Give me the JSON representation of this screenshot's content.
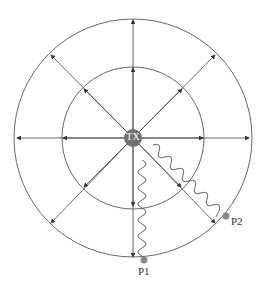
{
  "diagram": {
    "center_label": "TX",
    "points": [
      {
        "label": "P1",
        "x": 144,
        "y": 260
      },
      {
        "label": "P2",
        "x": 226,
        "y": 216
      }
    ],
    "colors": {
      "line": "#444444",
      "node": "#707070",
      "point": "#888888"
    },
    "caption": ""
  }
}
